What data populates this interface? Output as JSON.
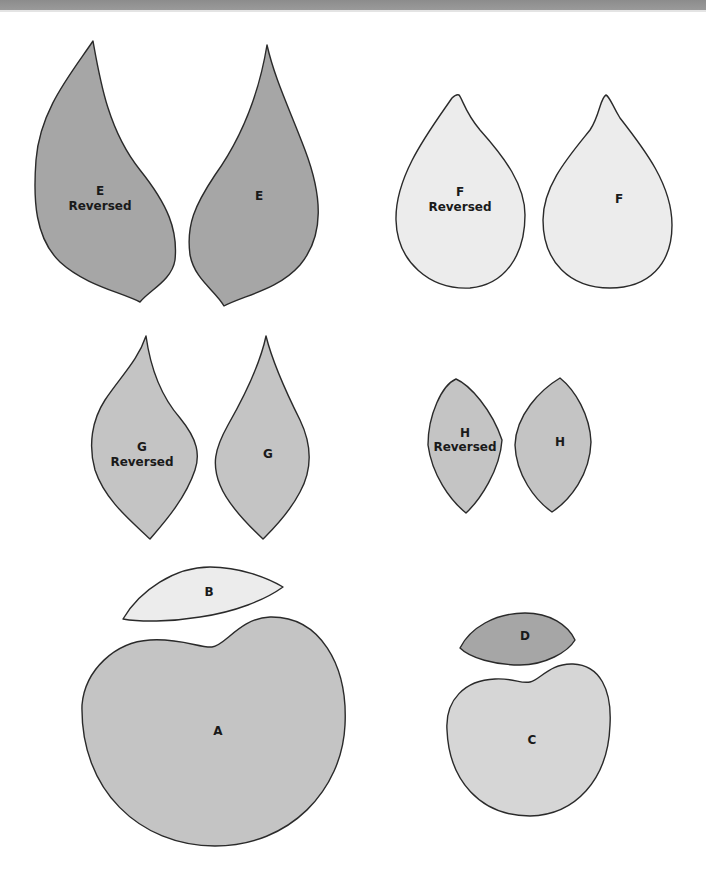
{
  "colors": {
    "dark_gray": "#a6a6a6",
    "medium_gray": "#c4c4c4",
    "light_gray": "#d6d6d6",
    "very_light": "#ececec",
    "outline": "#2a2a2a",
    "banner": "#939393"
  },
  "pieces": {
    "e_reversed": {
      "letter": "E",
      "sub": "Reversed"
    },
    "e": {
      "letter": "E"
    },
    "f_reversed": {
      "letter": "F",
      "sub": "Reversed"
    },
    "f": {
      "letter": "F"
    },
    "g_reversed": {
      "letter": "G",
      "sub": "Reversed"
    },
    "g": {
      "letter": "G"
    },
    "h_reversed": {
      "letter": "H",
      "sub": "Reversed"
    },
    "h": {
      "letter": "H"
    },
    "b": {
      "letter": "B"
    },
    "a": {
      "letter": "A"
    },
    "d": {
      "letter": "D"
    },
    "c": {
      "letter": "C"
    }
  }
}
